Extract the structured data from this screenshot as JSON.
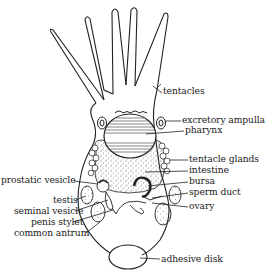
{
  "diagram": {
    "labels": {
      "right": [
        {
          "id": "tentacles",
          "text": "tentacles",
          "x": 163,
          "y": 90
        },
        {
          "id": "excretory_ampulla",
          "text": "excretory ampulla",
          "x": 182,
          "y": 118
        },
        {
          "id": "pharynx",
          "text": "pharynx",
          "x": 185,
          "y": 128
        },
        {
          "id": "tentacle_glands",
          "text": "tentacle glands",
          "x": 189,
          "y": 157
        },
        {
          "id": "intestine",
          "text": "intestine",
          "x": 189,
          "y": 168
        },
        {
          "id": "bursa",
          "text": "bursa",
          "x": 189,
          "y": 179
        },
        {
          "id": "sperm_duct",
          "text": "sperm duct",
          "x": 189,
          "y": 190
        },
        {
          "id": "ovary",
          "text": "ovary",
          "x": 189,
          "y": 204
        },
        {
          "id": "adhesive_disk",
          "text": "adhesive disk",
          "x": 161,
          "y": 256
        }
      ],
      "left": [
        {
          "id": "prostatic_vesicle",
          "text": "prostatic vesicle",
          "x": 1,
          "y": 178
        },
        {
          "id": "testis",
          "text": "testis",
          "x": 53,
          "y": 197
        },
        {
          "id": "seminal_vesicle",
          "text": "seminal vesicle",
          "x": 14,
          "y": 208
        },
        {
          "id": "penis_stylet",
          "text": "penis stylet",
          "x": 31,
          "y": 219
        },
        {
          "id": "common_antrum",
          "text": "common antrum",
          "x": 14,
          "y": 231
        }
      ]
    },
    "colors": {
      "ink": "#222222",
      "background": "#ffffff"
    }
  }
}
